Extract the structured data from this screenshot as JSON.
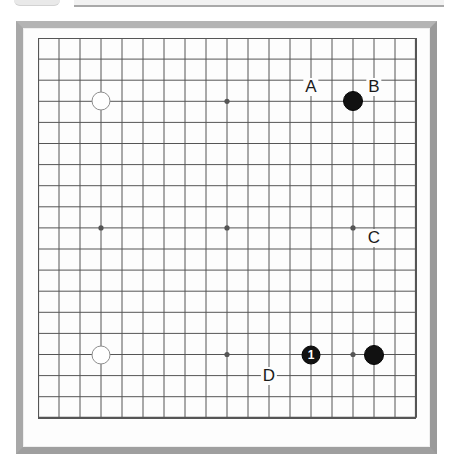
{
  "app": {
    "title": "Go board diagram",
    "board_size": 19,
    "frame_color": "#a8a8a8",
    "surface_color": "#fdfdfd",
    "line_color": "#555555",
    "black_stone_color": "#111111",
    "white_stone_color": "#ffffff"
  },
  "top_artifacts": [
    {
      "name": "cropped-tab-fragment"
    },
    {
      "name": "cropped-toolbar-fragment"
    }
  ],
  "board": {
    "columns": 19,
    "rows": 19,
    "star_points": [
      {
        "col": 3,
        "row": 3
      },
      {
        "col": 9,
        "row": 3
      },
      {
        "col": 15,
        "row": 3
      },
      {
        "col": 3,
        "row": 9
      },
      {
        "col": 9,
        "row": 9
      },
      {
        "col": 15,
        "row": 9
      },
      {
        "col": 3,
        "row": 15
      },
      {
        "col": 9,
        "row": 15
      },
      {
        "col": 15,
        "row": 15
      }
    ],
    "stones": [
      {
        "color": "white",
        "col": 3,
        "row": 3,
        "label": ""
      },
      {
        "color": "black",
        "col": 15,
        "row": 3,
        "label": ""
      },
      {
        "color": "white",
        "col": 3,
        "row": 15,
        "label": ""
      },
      {
        "color": "black",
        "col": 13,
        "row": 15,
        "label": "1"
      },
      {
        "color": "black",
        "col": 16,
        "row": 15,
        "label": ""
      }
    ],
    "labels": [
      {
        "text": "A",
        "col": 13,
        "row": 2.3
      },
      {
        "text": "B",
        "col": 16,
        "row": 2.3
      },
      {
        "text": "C",
        "col": 16,
        "row": 9.5
      },
      {
        "text": "D",
        "col": 11,
        "row": 16
      }
    ]
  }
}
